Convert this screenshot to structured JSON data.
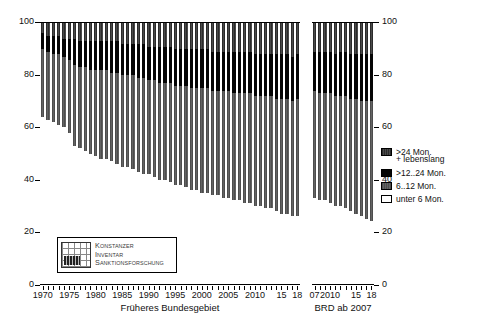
{
  "title": "",
  "axes": {
    "y_left_ticks": [
      "0",
      "20",
      "40",
      "60",
      "80",
      "100"
    ],
    "y_right_ticks": [
      "0",
      "20",
      "40",
      "60",
      "80",
      "100"
    ],
    "ylim": [
      0,
      100
    ]
  },
  "panels": [
    {
      "name": "panel-a",
      "title": "Früheres Bundesgebiet"
    },
    {
      "name": "panel-b",
      "title": "BRD ab 2007"
    }
  ],
  "legend": {
    "items": [
      {
        "label": ">24 Mon.",
        "sublabel": "+ lebenslang",
        "key": "over24",
        "color": "#3a3a3a"
      },
      {
        "label": ">12..24 Mon.",
        "sublabel": "",
        "key": "m12to24",
        "color": "#050505"
      },
      {
        "label": "6..12 Mon.",
        "sublabel": "",
        "key": "m6to12",
        "color": "#595959"
      },
      {
        "label": "unter 6 Mon.",
        "sublabel": "",
        "key": "under6",
        "color": "#ffffff"
      }
    ]
  },
  "watermark": {
    "line1_cap": "K",
    "line1": "ONSTANZER",
    "line2_cap": "I",
    "line2": "NVENTAR",
    "line3_cap": "S",
    "line3": "ANKTIONSFORSCHUNG"
  },
  "chart_data": {
    "type": "bar",
    "title": "",
    "xlabel": "",
    "ylabel": "",
    "ylim": [
      0,
      100
    ],
    "stacked": true,
    "percent": true,
    "grid": false,
    "legend_position": "right",
    "series_order_bottom_to_top": [
      "under6",
      "m6to12",
      "m12to24",
      "over24"
    ],
    "series_labels": {
      "under6": "unter 6 Mon.",
      "m6to12": "6..12 Mon.",
      "m12to24": ">12..24 Mon.",
      "over24": ">24 Mon. + lebenslang"
    },
    "panels": [
      {
        "name": "Früheres Bundesgebiet",
        "categories": [
          "1970",
          "1971",
          "1972",
          "1973",
          "1974",
          "1975",
          "1976",
          "1977",
          "1978",
          "1979",
          "1980",
          "1981",
          "1982",
          "1983",
          "1984",
          "1985",
          "1986",
          "1987",
          "1988",
          "1989",
          "1990",
          "1991",
          "1992",
          "1993",
          "1994",
          "1995",
          "1996",
          "1997",
          "1998",
          "1999",
          "2000",
          "2001",
          "2002",
          "2003",
          "2004",
          "2005",
          "2006",
          "2007",
          "2008",
          "2009",
          "2010",
          "2011",
          "2012",
          "2013",
          "2014",
          "2015",
          "2016",
          "2017",
          "2018"
        ],
        "tick_labels": [
          "1970",
          "1975",
          "1980",
          "1985",
          "1990",
          "1995",
          "2000",
          "2005",
          "2010",
          "15",
          "18"
        ],
        "series": [
          {
            "name": "under6",
            "values": [
              64,
              63,
              62,
              61,
              60,
              58,
              53,
              52,
              51,
              50,
              49,
              48,
              48,
              47,
              46,
              45,
              45,
              44,
              43,
              42,
              42,
              41,
              40,
              40,
              39,
              38,
              38,
              37,
              36,
              36,
              35,
              35,
              34,
              34,
              33,
              33,
              32,
              32,
              31,
              31,
              30,
              30,
              29,
              29,
              28,
              27,
              27,
              26,
              26
            ]
          },
          {
            "name": "m6to12",
            "values": [
              26,
              26,
              26,
              27,
              27,
              28,
              31,
              31,
              32,
              32,
              33,
              34,
              34,
              34,
              35,
              35,
              35,
              36,
              36,
              37,
              36,
              37,
              37,
              37,
              38,
              38,
              38,
              39,
              39,
              39,
              40,
              40,
              40,
              40,
              41,
              41,
              41,
              41,
              42,
              42,
              42,
              42,
              43,
              43,
              43,
              44,
              44,
              44,
              45
            ]
          },
          {
            "name": "m12to24",
            "values": [
              6,
              6,
              7,
              7,
              7,
              8,
              10,
              10,
              10,
              11,
              11,
              11,
              11,
              12,
              12,
              12,
              12,
              12,
              13,
              13,
              13,
              13,
              14,
              14,
              14,
              14,
              14,
              14,
              15,
              15,
              15,
              15,
              15,
              15,
              15,
              15,
              16,
              16,
              16,
              16,
              16,
              16,
              16,
              16,
              17,
              17,
              17,
              17,
              17
            ]
          },
          {
            "name": "over24",
            "values": [
              4,
              5,
              5,
              5,
              6,
              6,
              6,
              7,
              7,
              7,
              7,
              7,
              7,
              7,
              7,
              8,
              8,
              8,
              8,
              8,
              9,
              9,
              9,
              9,
              9,
              10,
              10,
              10,
              10,
              10,
              10,
              10,
              11,
              11,
              11,
              11,
              11,
              11,
              11,
              11,
              12,
              12,
              12,
              12,
              12,
              12,
              12,
              13,
              12
            ]
          }
        ]
      },
      {
        "name": "BRD ab 2007",
        "categories": [
          "2007",
          "2008",
          "2009",
          "2010",
          "2011",
          "2012",
          "2013",
          "2014",
          "2015",
          "2016",
          "2017",
          "2018"
        ],
        "tick_labels": [
          "07",
          "2010",
          "15",
          "18"
        ],
        "series": [
          {
            "name": "under6",
            "values": [
              33,
              32,
              32,
              31,
              30,
              30,
              29,
              28,
              27,
              26,
              25,
              24
            ]
          },
          {
            "name": "m6to12",
            "values": [
              41,
              41,
              41,
              42,
              42,
              42,
              43,
              43,
              44,
              44,
              45,
              46
            ]
          },
          {
            "name": "m12to24",
            "values": [
              15,
              16,
              16,
              16,
              16,
              17,
              17,
              17,
              17,
              18,
              18,
              18
            ]
          },
          {
            "name": "over24",
            "values": [
              11,
              11,
              11,
              11,
              12,
              11,
              11,
              12,
              12,
              12,
              12,
              12
            ]
          }
        ]
      }
    ]
  }
}
